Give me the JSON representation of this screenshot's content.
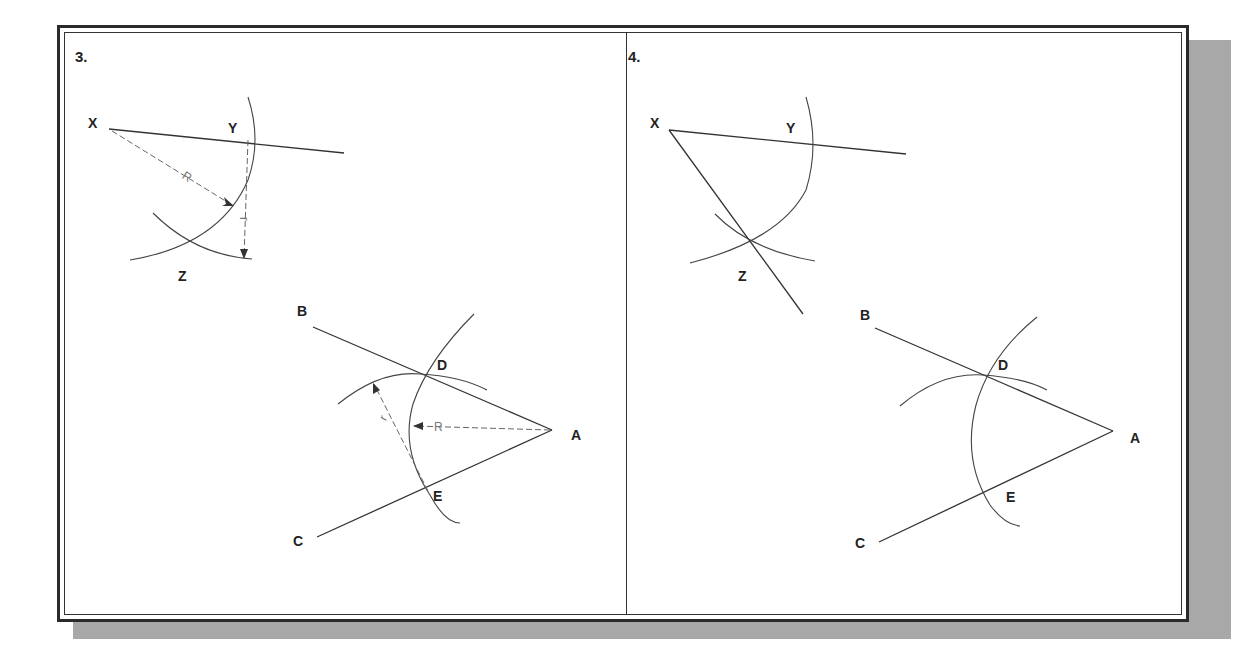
{
  "figure": {
    "panels": [
      {
        "step": "3.",
        "points": {
          "X": "X",
          "Y": "Y",
          "Z": "Z",
          "A": "A",
          "B": "B",
          "C": "C",
          "D": "D",
          "E": "E"
        },
        "dimension_labels": {
          "R_upper": "R",
          "r_upper": "r",
          "R_lower": "R",
          "r_lower": "r"
        }
      },
      {
        "step": "4.",
        "points": {
          "X": "X",
          "Y": "Y",
          "Z": "Z",
          "A": "A",
          "B": "B",
          "C": "C",
          "D": "D",
          "E": "E"
        }
      }
    ],
    "colors": {
      "line": "#333333",
      "shadow": "#a8a8a8",
      "background": "#ffffff"
    }
  }
}
